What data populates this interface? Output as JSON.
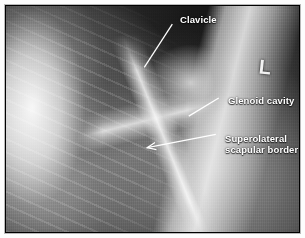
{
  "figure": {
    "kind": "radiograph",
    "modality": "X-ray",
    "view": "shoulder scapular-Y lateral view",
    "background_color": "#000000",
    "frame_color": "#b9b9b9",
    "page_color": "#ffffff",
    "annotation_color": "#ffffff"
  },
  "annotations": [
    {
      "id": "clavicle",
      "text": "Clavicle",
      "lines": [
        "Clavicle"
      ],
      "text_x": 174,
      "text_y": 8,
      "leader": {
        "from_x": 172,
        "from_y": 19,
        "to_x": 143,
        "to_y": 64,
        "arrow": false
      }
    },
    {
      "id": "glenoid-cavity",
      "text": "Glenoid cavity",
      "lines": [
        "Glenoid cavity"
      ],
      "text_x": 222,
      "text_y": 89,
      "leader": {
        "from_x": 220,
        "from_y": 96,
        "to_x": 189,
        "to_y": 115,
        "arrow": false
      }
    },
    {
      "id": "superolateral-scapular-border",
      "text": "Superolateral scapular border",
      "lines": [
        "Superolateral",
        "scapular border"
      ],
      "text_x": 219,
      "text_y": 127,
      "leader": {
        "from_x": 217,
        "from_y": 134,
        "to_x": 146,
        "to_y": 148,
        "arrow": true
      }
    }
  ],
  "side_marker": {
    "label": "L",
    "meaning": "left side radiographic marker",
    "x": 253,
    "y": 51
  }
}
